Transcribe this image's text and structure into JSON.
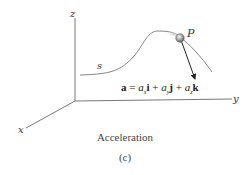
{
  "figure": {
    "axes": {
      "x_label": "x",
      "y_label": "y",
      "z_label": "z"
    },
    "path_label": "s",
    "point_label": "P",
    "equation": {
      "lhs": "a",
      "equals": "=",
      "terms": [
        {
          "coef": "a",
          "sub": "x",
          "unit": "i"
        },
        {
          "coef": "a",
          "sub": "y",
          "unit": "j"
        },
        {
          "coef": "a",
          "sub": "z",
          "unit": "k"
        }
      ],
      "plus": "+"
    },
    "caption": "Acceleration",
    "subcaption": "(c)"
  }
}
